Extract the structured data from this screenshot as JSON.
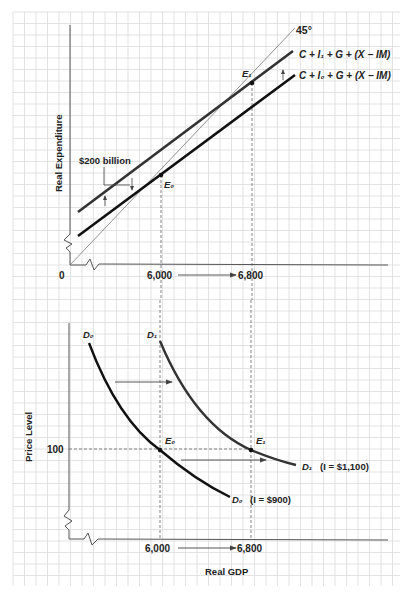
{
  "top_chart": {
    "y_axis_label": "Real Expenditure",
    "origin_label": "0",
    "x_tick_from": "6,000",
    "x_tick_to": "6,800",
    "angle_label": "45°",
    "line_upper_label": "C + I₁ + G + (X − IM)",
    "line_lower_label": "C + I₀ + G + (X − IM)",
    "shift_label": "$200 billion",
    "point_e0": "E₀",
    "point_e1": "E₁"
  },
  "bottom_chart": {
    "y_axis_label": "Price Level",
    "x_axis_label": "Real GDP",
    "price_tick": "100",
    "x_tick_from": "6,000",
    "x_tick_to": "6,800",
    "d0_top_label": "D₀",
    "d1_top_label": "D₁",
    "d0_end_label": "D₀",
    "d0_note": "(I = $900)",
    "d1_end_label": "D₁",
    "d1_note": "(I = $1,100)",
    "point_e0": "E₀",
    "point_e1": "E₁"
  },
  "colors": {
    "grid": "#dcdcdc",
    "axis": "#555555",
    "curve_initial": "#111111",
    "curve_shifted": "#333333",
    "arrow": "#444444",
    "text": "#222222"
  },
  "chart_data": [
    {
      "type": "line",
      "title": "Income-Expenditure Diagram",
      "xlabel": "",
      "ylabel": "Real Expenditure",
      "x_ticks": [
        "0",
        "6,000",
        "6,800"
      ],
      "series": [
        {
          "name": "45° line",
          "x": [
            0,
            6800
          ],
          "y": [
            0,
            6800
          ]
        },
        {
          "name": "C + I0 + G + (X - IM)",
          "equilibrium": {
            "label": "E0",
            "x": 6000,
            "y": 6000
          }
        },
        {
          "name": "C + I1 + G + (X - IM)",
          "equilibrium": {
            "label": "E1",
            "x": 6800,
            "y": 6800
          }
        }
      ],
      "annotations": [
        "$200 billion upward shift",
        "45°",
        "6,000 → 6,800"
      ]
    },
    {
      "type": "line",
      "title": "Aggregate Demand Shift",
      "xlabel": "Real GDP",
      "ylabel": "Price Level",
      "x_ticks": [
        "6,000",
        "6,800"
      ],
      "y_ticks": [
        "100"
      ],
      "series": [
        {
          "name": "D0 (I = $900)",
          "equilibrium": {
            "label": "E0",
            "x": 6000,
            "y": 100
          }
        },
        {
          "name": "D1 (I = $1,100)",
          "equilibrium": {
            "label": "E1",
            "x": 6800,
            "y": 100
          }
        }
      ],
      "annotations": [
        "Rightward shift of demand curve",
        "6,000 → 6,800"
      ]
    }
  ]
}
